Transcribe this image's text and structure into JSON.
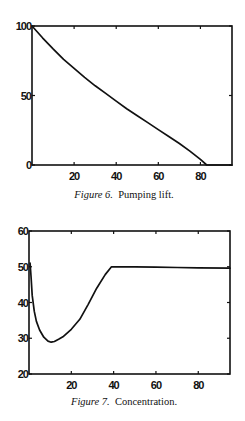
{
  "chart_data": [
    {
      "type": "line",
      "title": "",
      "caption_label": "Figure 6.",
      "caption_text": "Pumping lift.",
      "xlabel": "",
      "ylabel": "",
      "xlim": [
        0,
        95
      ],
      "ylim": [
        0,
        100
      ],
      "xticks": [
        20,
        40,
        60,
        80
      ],
      "yticks": [
        0,
        50,
        100
      ],
      "xtick_labels": [
        "20",
        "40",
        "60",
        "80"
      ],
      "ytick_labels": [
        "0",
        "50",
        "100"
      ],
      "grid": false,
      "series": [
        {
          "name": "Pumping lift",
          "x": [
            0,
            5,
            10,
            15,
            20,
            25,
            30,
            35,
            40,
            45,
            50,
            55,
            60,
            65,
            70,
            75,
            80,
            83,
            95
          ],
          "y": [
            100,
            91.5,
            83.5,
            76,
            69.5,
            63,
            57,
            51.5,
            46,
            40.5,
            35.5,
            30.5,
            25.5,
            20.5,
            15.5,
            10,
            4,
            0,
            0
          ]
        }
      ]
    },
    {
      "type": "line",
      "title": "",
      "caption_label": "Figure 7.",
      "caption_text": "Concentration.",
      "xlabel": "",
      "ylabel": "",
      "xlim": [
        0,
        95
      ],
      "ylim": [
        20,
        60
      ],
      "xticks": [
        20,
        40,
        60,
        80
      ],
      "yticks": [
        20,
        30,
        40,
        50,
        60
      ],
      "xtick_labels": [
        "20",
        "40",
        "60",
        "80"
      ],
      "ytick_labels": [
        "20",
        "30",
        "40",
        "50",
        "60"
      ],
      "grid": false,
      "series": [
        {
          "name": "Concentration",
          "x": [
            0.5,
            1,
            1.5,
            2.5,
            3.5,
            5,
            7,
            9,
            10.5,
            12,
            14,
            16,
            20,
            24,
            28,
            32,
            36,
            39,
            50,
            60,
            70,
            80,
            95
          ],
          "y": [
            51,
            47,
            42,
            37.5,
            34.7,
            32.3,
            30.3,
            29.2,
            28.9,
            29.1,
            29.7,
            30.4,
            32.5,
            35.3,
            39.5,
            44,
            47.8,
            50,
            50,
            49.9,
            49.8,
            49.7,
            49.6
          ]
        }
      ]
    }
  ]
}
